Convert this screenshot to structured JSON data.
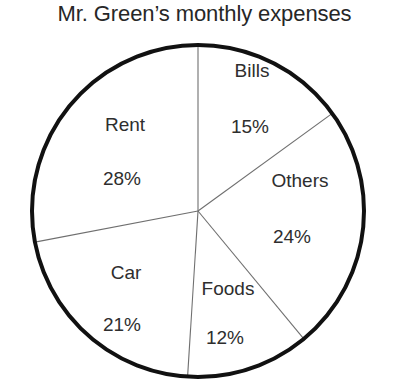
{
  "chart_data": {
    "type": "pie",
    "title": "Mr. Green’s monthly expenses",
    "xlabel": "",
    "ylabel": "",
    "legend": "none",
    "grid": false,
    "units": "percent",
    "total": 100,
    "start_angle_deg": 0,
    "direction": "clockwise",
    "categories": [
      "Bills",
      "Others",
      "Foods",
      "Car",
      "Rent"
    ],
    "values": [
      15,
      24,
      12,
      21,
      28
    ],
    "slices": [
      {
        "label": "Bills",
        "value": 15,
        "value_text": "15%",
        "start_deg": 0,
        "end_deg": 54,
        "label_x": 252,
        "label_y": 70,
        "value_x": 250,
        "value_y": 126
      },
      {
        "label": "Others",
        "value": 24,
        "value_text": "24%",
        "start_deg": 54,
        "end_deg": 140.4,
        "label_x": 300,
        "label_y": 180,
        "value_x": 292,
        "value_y": 236
      },
      {
        "label": "Foods",
        "value": 12,
        "value_text": "12%",
        "start_deg": 140.4,
        "end_deg": 183.6,
        "label_x": 228,
        "label_y": 288,
        "value_x": 225,
        "value_y": 337
      },
      {
        "label": "Car",
        "value": 21,
        "value_text": "21%",
        "start_deg": 183.6,
        "end_deg": 259.2,
        "label_x": 126,
        "label_y": 272,
        "value_x": 122,
        "value_y": 324
      },
      {
        "label": "Rent",
        "value": 28,
        "value_text": "28%",
        "start_deg": 259.2,
        "end_deg": 360,
        "label_x": 125,
        "label_y": 124,
        "value_x": 122,
        "value_y": 178
      }
    ],
    "geometry": {
      "center_x": 198,
      "center_y": 211,
      "radius": 166
    },
    "colors": {
      "background": "#ffffff",
      "slice_fill": "#ffffff",
      "outline": "#111111",
      "divider": "#6f6f6f",
      "text": "#2e2e2e"
    }
  }
}
